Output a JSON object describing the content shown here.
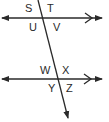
{
  "colors": {
    "stroke": "#2a2a2a",
    "background": "#ffffff"
  },
  "lines": {
    "top_parallel": {
      "y": 18,
      "x1": 2,
      "x2": 102
    },
    "bottom_parallel": {
      "y": 79,
      "x1": 2,
      "x2": 102
    },
    "transversal": {
      "x1": 38,
      "y1": 0,
      "x2": 68,
      "y2": 118
    }
  },
  "labels": {
    "top_intersection": [
      "S",
      "T",
      "U",
      "V"
    ],
    "bottom_intersection": [
      "W",
      "X",
      "Y",
      "Z"
    ],
    "S": "S",
    "T": "T",
    "U": "U",
    "V": "V",
    "W": "W",
    "X": "X",
    "Y": "Y",
    "Z": "Z"
  },
  "markers": {
    "parallel_mark": "single-chevron"
  }
}
